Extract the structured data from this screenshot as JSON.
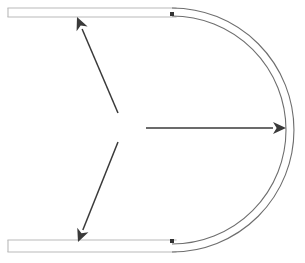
{
  "figure": {
    "width": 305,
    "height": 263,
    "background_color": "#ffffff"
  },
  "geometry": {
    "wall_color": "#b9b9b9",
    "arc_color": "#6e6e6e",
    "arrow_color": "#3a3a3a",
    "junction_color": "#333333",
    "wall_stroke_width": 1.1,
    "arc_stroke_width": 1.1,
    "arrow_stroke_width": 1.5
  },
  "channel": {
    "top_segment": {
      "name": "top-straight-channel",
      "x_start": 8,
      "x_end": 176,
      "outer_wall_y": 8,
      "inner_wall_y": 17
    },
    "bottom_segment": {
      "name": "bottom-straight-channel",
      "x_start": 8,
      "x_end": 176,
      "inner_wall_y": 240,
      "outer_wall_y": 252
    },
    "bend": {
      "name": "semicircular-bend",
      "center_x": 172,
      "center_y": 130,
      "outer_radius": 122,
      "inner_radius": 114,
      "sweep_degrees": 180,
      "opening": "left"
    }
  },
  "junctions": [
    {
      "label": "top-junction",
      "x": 172,
      "y": 14,
      "size": 4
    },
    {
      "label": "bottom-junction",
      "x": 172,
      "y": 241,
      "size": 4
    }
  ],
  "arrows": [
    {
      "label": "upper-outflow-arrow",
      "direction": "up-left",
      "tail_x": 118,
      "tail_y": 113,
      "tip_x": 77,
      "tip_y": 17,
      "head_length": 13,
      "head_width": 6
    },
    {
      "label": "horizontal-flow-arrow",
      "direction": "right",
      "tail_x": 146,
      "tail_y": 128,
      "tip_x": 286,
      "tip_y": 128,
      "head_length": 13,
      "head_width": 6
    },
    {
      "label": "lower-outflow-arrow",
      "direction": "down-left",
      "tail_x": 118,
      "tail_y": 142,
      "tip_x": 78,
      "tip_y": 242,
      "head_length": 13,
      "head_width": 6
    }
  ]
}
